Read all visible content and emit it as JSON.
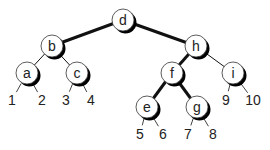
{
  "diagram": {
    "type": "binary-search-tree",
    "nodes": [
      {
        "id": "d",
        "label": "d",
        "x": 123,
        "y": 20
      },
      {
        "id": "b",
        "label": "b",
        "x": 52,
        "y": 46
      },
      {
        "id": "h",
        "label": "h",
        "x": 196,
        "y": 46
      },
      {
        "id": "a",
        "label": "a",
        "x": 27,
        "y": 73
      },
      {
        "id": "c",
        "label": "c",
        "x": 77,
        "y": 73
      },
      {
        "id": "f",
        "label": "f",
        "x": 172,
        "y": 73
      },
      {
        "id": "i",
        "label": "i",
        "x": 233,
        "y": 73
      },
      {
        "id": "e",
        "label": "e",
        "x": 147,
        "y": 107
      },
      {
        "id": "g",
        "label": "g",
        "x": 197,
        "y": 107
      }
    ],
    "leaves": [
      {
        "id": "1",
        "label": "1",
        "x": 12,
        "y": 100,
        "parent": "a"
      },
      {
        "id": "2",
        "label": "2",
        "x": 42,
        "y": 100,
        "parent": "a"
      },
      {
        "id": "3",
        "label": "3",
        "x": 66,
        "y": 100,
        "parent": "c"
      },
      {
        "id": "4",
        "label": "4",
        "x": 91,
        "y": 100,
        "parent": "c"
      },
      {
        "id": "5",
        "label": "5",
        "x": 140,
        "y": 134,
        "parent": "e"
      },
      {
        "id": "6",
        "label": "6",
        "x": 163,
        "y": 134,
        "parent": "e"
      },
      {
        "id": "7",
        "label": "7",
        "x": 188,
        "y": 134,
        "parent": "g"
      },
      {
        "id": "8",
        "label": "8",
        "x": 213,
        "y": 134,
        "parent": "g"
      },
      {
        "id": "9",
        "label": "9",
        "x": 226,
        "y": 100,
        "parent": "i"
      },
      {
        "id": "10",
        "label": "10",
        "x": 253,
        "y": 100,
        "parent": "i"
      }
    ],
    "edges": [
      {
        "from": "d",
        "to": "b",
        "bold": true
      },
      {
        "from": "d",
        "to": "h",
        "bold": true
      },
      {
        "from": "b",
        "to": "a",
        "bold": false
      },
      {
        "from": "b",
        "to": "c",
        "bold": false
      },
      {
        "from": "h",
        "to": "f",
        "bold": true
      },
      {
        "from": "h",
        "to": "i",
        "bold": false
      },
      {
        "from": "f",
        "to": "e",
        "bold": true
      },
      {
        "from": "f",
        "to": "g",
        "bold": true
      }
    ],
    "colors": {
      "line": "#111111",
      "node_fill": "#ffffff",
      "node_stroke": "#333333",
      "shadow": "#000000"
    }
  }
}
